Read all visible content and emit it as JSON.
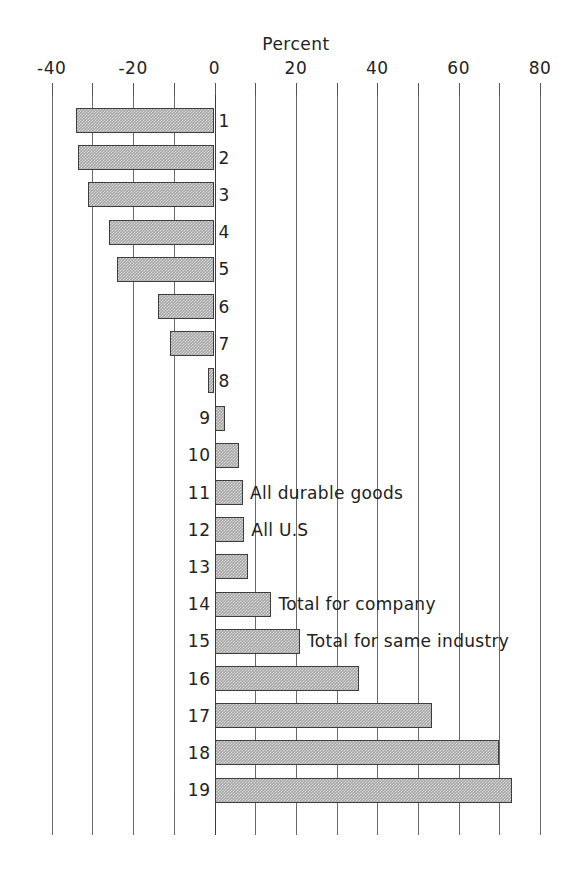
{
  "chart_data": {
    "type": "bar",
    "orientation": "horizontal",
    "title": "Percent",
    "xlabel": "Percent",
    "ylabel": "",
    "xlim": [
      -40,
      80
    ],
    "xticks": [
      -40,
      -30,
      -20,
      -10,
      0,
      10,
      20,
      30,
      40,
      50,
      60,
      70,
      80
    ],
    "xtick_labels": [
      "-40",
      "",
      "-20",
      "",
      "0",
      "",
      "20",
      "",
      "40",
      "",
      "60",
      "",
      "80"
    ],
    "grid": true,
    "grid_axis": "x",
    "legend": "none",
    "categories": [
      "1",
      "2",
      "3",
      "4",
      "5",
      "6",
      "7",
      "8",
      "9",
      "10",
      "11",
      "12",
      "13",
      "14",
      "15",
      "16",
      "17",
      "18",
      "19"
    ],
    "values": [
      -34,
      -33.5,
      -31,
      -26,
      -24,
      -14,
      -11,
      -1.6,
      2.5,
      6,
      7,
      7.3,
      8.3,
      14,
      21,
      35.5,
      53.5,
      70,
      73
    ],
    "annotations": [
      {
        "category": "11",
        "text": "All durable goods"
      },
      {
        "category": "12",
        "text": "All U.S"
      },
      {
        "category": "14",
        "text": "Total for company"
      },
      {
        "category": "15",
        "text": "Total for same industry"
      }
    ],
    "bar_fill_color": "#a5a5a5",
    "bar_edge_color": "#3d3d3d",
    "axis_color": "#6a6a6a",
    "background_color": "#ffffff"
  },
  "axis": {
    "labeled_ticks": [
      {
        "value": -40,
        "label": "-40"
      },
      {
        "value": -20,
        "label": "-20"
      },
      {
        "value": 0,
        "label": "0"
      },
      {
        "value": 20,
        "label": "20"
      },
      {
        "value": 40,
        "label": "40"
      },
      {
        "value": 60,
        "label": "60"
      },
      {
        "value": 80,
        "label": "80"
      }
    ]
  }
}
